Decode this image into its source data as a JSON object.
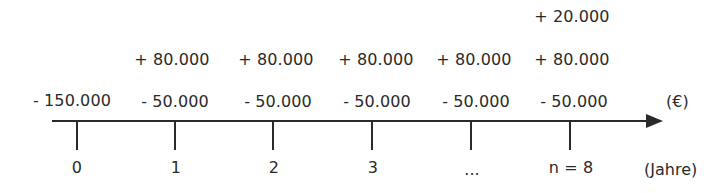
{
  "diagram": {
    "type": "cash-flow timeline",
    "axis": {
      "unit_label": "(€)",
      "time_unit_label": "(Jahre)"
    },
    "periods": [
      {
        "label": "0",
        "outflow": "- 150.000",
        "inflow": "",
        "extra_inflow": ""
      },
      {
        "label": "1",
        "outflow": "- 50.000",
        "inflow": "+ 80.000",
        "extra_inflow": ""
      },
      {
        "label": "2",
        "outflow": "- 50.000",
        "inflow": "+ 80.000",
        "extra_inflow": ""
      },
      {
        "label": "3",
        "outflow": "- 50.000",
        "inflow": "+ 80.000",
        "extra_inflow": ""
      },
      {
        "label": "...",
        "outflow": "- 50.000",
        "inflow": "+ 80.000",
        "extra_inflow": ""
      },
      {
        "label": "n = 8",
        "outflow": "- 50.000",
        "inflow": "+ 80.000",
        "extra_inflow": "+ 20.000"
      }
    ]
  }
}
